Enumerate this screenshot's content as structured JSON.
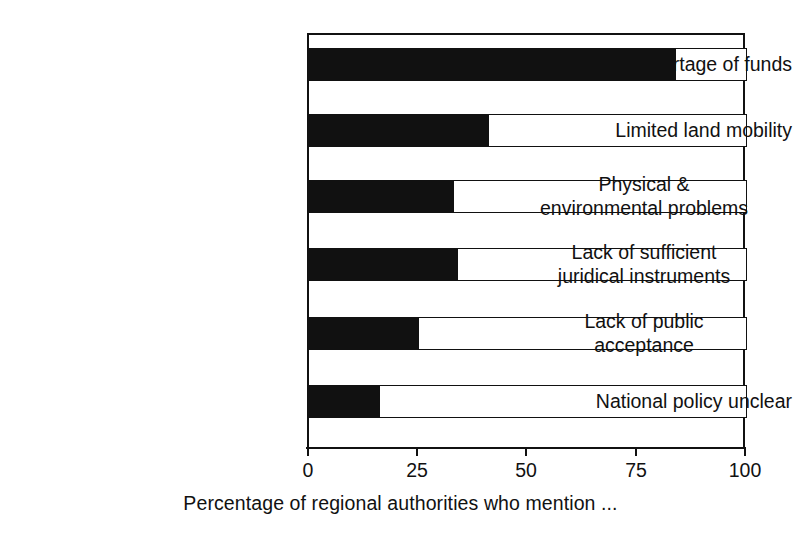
{
  "chart_data": {
    "type": "bar",
    "orientation": "horizontal",
    "title": "",
    "subtitle": "",
    "xlabel": "Percentage of regional authorities who mention ...",
    "ylabel": "",
    "xlim": [
      0,
      100
    ],
    "xticks": [
      0,
      25,
      50,
      75,
      100
    ],
    "xtick_labels": [
      "0",
      "25",
      "50",
      "75",
      "100"
    ],
    "grid": false,
    "legend": null,
    "bar_color": "#111111",
    "track_color": "#ffffff",
    "border_color": "#111111",
    "background": "#ffffff",
    "categories": [
      "Shortage of funds",
      "Limited land mobility",
      "Physical &\nenvironmental problems",
      "Lack of sufficient\njuridical instruments",
      "Lack of public\nacceptance",
      "National policy unclear"
    ],
    "values": [
      84,
      41,
      33,
      34,
      25,
      16
    ],
    "series": [
      {
        "name": "Percentage of regional authorities who mention ...",
        "values": [
          84,
          41,
          33,
          34,
          25,
          16
        ]
      }
    ],
    "annotations": []
  },
  "axis": {
    "x_title": "Percentage of regional authorities who mention ...",
    "ticks": [
      {
        "label": "0",
        "value": 0
      },
      {
        "label": "25",
        "value": 25
      },
      {
        "label": "50",
        "value": 50
      },
      {
        "label": "75",
        "value": 75
      },
      {
        "label": "100",
        "value": 100
      }
    ]
  },
  "bars": [
    {
      "label": "Shortage of funds",
      "value": 84
    },
    {
      "label": "Limited land mobility",
      "value": 41
    },
    {
      "label": "Physical &\nenvironmental problems",
      "value": 33
    },
    {
      "label": "Lack of sufficient\njuridical instruments",
      "value": 34
    },
    {
      "label": "Lack of public\nacceptance",
      "value": 25
    },
    {
      "label": "National policy unclear",
      "value": 16
    }
  ]
}
